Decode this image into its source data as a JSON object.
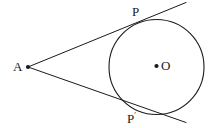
{
  "figure": {
    "type": "geometry-diagram",
    "background_color": "#ffffff",
    "stroke_color": "#1a1a1a",
    "labels": {
      "external_point": "A",
      "tangent_point_upper": "P",
      "tangent_point_lower_base": "P",
      "tangent_point_lower_prime": "′",
      "centre": "O"
    },
    "points": {
      "A": {
        "x": 28,
        "y": 67,
        "dot": true,
        "dot_radius": 2.1
      },
      "O": {
        "x": 156.5,
        "y": 66,
        "dot": true,
        "dot_radius": 2.1
      },
      "P": {
        "x": 140.5,
        "y": 21.5,
        "dot": false
      },
      "Pprime": {
        "x": 140.5,
        "y": 111.5,
        "dot": false
      }
    },
    "circle": {
      "cx": 156.5,
      "cy": 67,
      "r": 47.5,
      "stroke_width": 1.1,
      "fill": "none"
    },
    "lines": [
      {
        "name": "tangent-upper",
        "from_x": 28,
        "from_y": 67,
        "to_x": 186,
        "to_y": 2.5,
        "stroke_width": 1.0
      },
      {
        "name": "tangent-lower",
        "from_x": 28,
        "from_y": 67,
        "to_x": 186,
        "to_y": 122.5,
        "stroke_width": 1.0
      }
    ]
  }
}
